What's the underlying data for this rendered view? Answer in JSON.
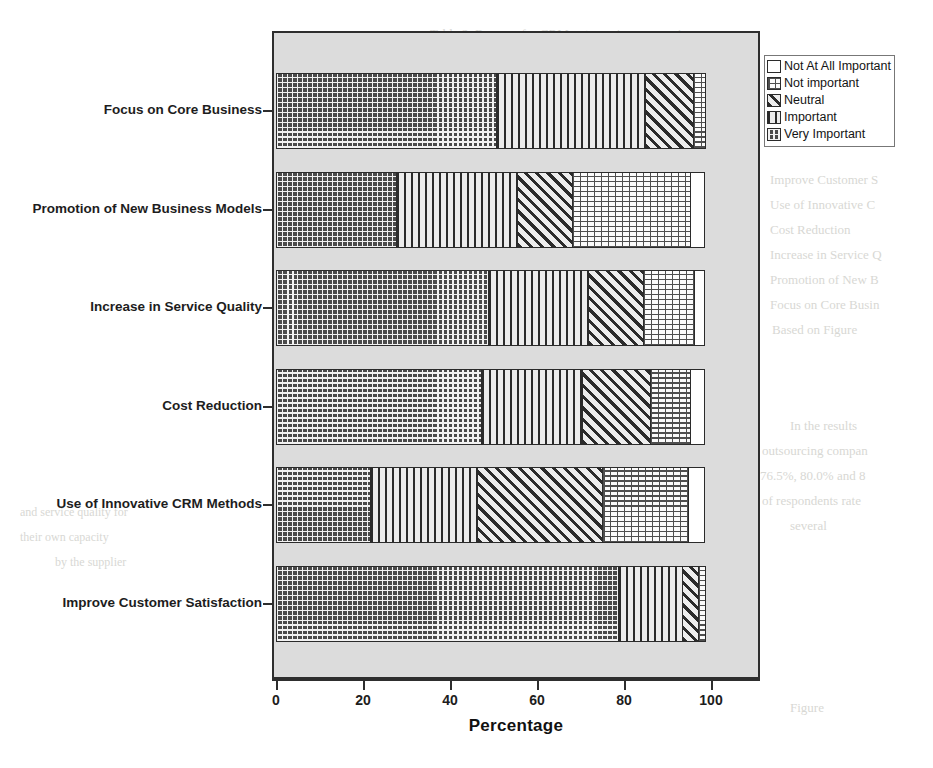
{
  "ghost_text": [
    {
      "text": "Table 2. Reasons for CRM outsourcing companies",
      "x": 430,
      "y": 26,
      "size": 13
    },
    {
      "text": "Issues",
      "x": 330,
      "y": 96,
      "size": 13
    },
    {
      "text": "Improve Customer S",
      "x": 770,
      "y": 172,
      "size": 13
    },
    {
      "text": "Use of Innovative C",
      "x": 770,
      "y": 197,
      "size": 13
    },
    {
      "text": "Cost Reduction",
      "x": 770,
      "y": 222,
      "size": 13
    },
    {
      "text": "Increase in Service Q",
      "x": 770,
      "y": 247,
      "size": 13
    },
    {
      "text": "Promotion of New B",
      "x": 770,
      "y": 272,
      "size": 13
    },
    {
      "text": "Focus on Core Busin",
      "x": 770,
      "y": 297,
      "size": 13
    },
    {
      "text": "Based on Figure",
      "x": 772,
      "y": 322,
      "size": 13
    },
    {
      "text": "In the results",
      "x": 790,
      "y": 418,
      "size": 13
    },
    {
      "text": "outsourcing compan",
      "x": 762,
      "y": 443,
      "size": 13
    },
    {
      "text": "76.5%, 80.0% and 8",
      "x": 760,
      "y": 468,
      "size": 13
    },
    {
      "text": "of respondents rate",
      "x": 762,
      "y": 493,
      "size": 13
    },
    {
      "text": "several",
      "x": 790,
      "y": 518,
      "size": 13
    },
    {
      "text": "and service quality for",
      "x": 20,
      "y": 505,
      "size": 12
    },
    {
      "text": "their own capacity",
      "x": 20,
      "y": 530,
      "size": 12
    },
    {
      "text": "by the supplier",
      "x": 55,
      "y": 555,
      "size": 12
    },
    {
      "text": "Figure",
      "x": 790,
      "y": 700,
      "size": 13
    }
  ],
  "chart_data": {
    "type": "bar",
    "orientation": "horizontal",
    "stacked": true,
    "title": "",
    "xlabel": "Percentage",
    "ylabel": "",
    "xlim": [
      0,
      100
    ],
    "xticks": [
      0,
      20,
      40,
      60,
      80,
      100
    ],
    "grid": false,
    "legend_position": "right",
    "categories": [
      "Focus on Core Business",
      "Promotion of New Business Models",
      "Increase in Service Quality",
      "Cost Reduction",
      "Use of Innovative CRM Methods",
      "Improve Customer Satisfaction"
    ],
    "series": [
      {
        "name": "Very Important",
        "pattern": "cross-hatch",
        "values": [
          51.0,
          28.0,
          49.0,
          47.5,
          22.0,
          79.0
        ]
      },
      {
        "name": "Important",
        "pattern": "vertical-lines",
        "values": [
          34.5,
          28.0,
          23.5,
          23.5,
          25.0,
          15.0
        ]
      },
      {
        "name": "Neutral",
        "pattern": "diagonal-hatch",
        "values": [
          11.5,
          13.0,
          13.0,
          16.0,
          29.0,
          4.0
        ]
      },
      {
        "name": "Not important",
        "pattern": "dotted",
        "values": [
          3.0,
          27.5,
          12.0,
          9.5,
          20.0,
          2.0
        ]
      },
      {
        "name": "Not At All Important",
        "pattern": "blank",
        "values": [
          0.0,
          3.5,
          2.5,
          3.5,
          4.0,
          0.0
        ]
      }
    ]
  },
  "axis": {
    "x_title": "Percentage",
    "tick_labels": [
      "0",
      "20",
      "40",
      "60",
      "80",
      "100"
    ]
  },
  "legend": {
    "items": [
      {
        "label": "Not At All Important",
        "pattern": "blank"
      },
      {
        "label": "Not important",
        "pattern": "dotted"
      },
      {
        "label": "Neutral",
        "pattern": "diagonal-hatch"
      },
      {
        "label": "Important",
        "pattern": "vertical-lines"
      },
      {
        "label": "Very Important",
        "pattern": "cross-hatch"
      }
    ]
  },
  "colors": {
    "plot_background": "#dcdcdc",
    "frame": "#2e2e2e",
    "text": "#1d1d1d",
    "page_background": "#ffffff"
  }
}
